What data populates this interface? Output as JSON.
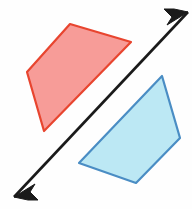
{
  "figure": {
    "canvas": {
      "width": 192,
      "height": 209,
      "background": "#fefefe"
    },
    "shapes": [
      {
        "id": "red-quadrilateral",
        "name": "preimage-quadrilateral",
        "kind": "quadrilateral",
        "role": "preimage",
        "fill": "#f79c98",
        "stroke": "#e8452f",
        "stroke_width": 2.2,
        "fill_opacity": 1,
        "points": "70,24 131,42 44,131 27,72",
        "vertices": [
          {
            "label": "A",
            "x": 70,
            "y": 24
          },
          {
            "label": "B",
            "x": 131,
            "y": 42
          },
          {
            "label": "C",
            "x": 44,
            "y": 131
          },
          {
            "label": "D",
            "x": 27,
            "y": 72
          }
        ]
      },
      {
        "id": "blue-quadrilateral",
        "name": "image-quadrilateral",
        "kind": "quadrilateral",
        "role": "image",
        "fill": "#bce8f4",
        "stroke": "#4a8dc4",
        "stroke_width": 2.2,
        "fill_opacity": 1,
        "points": "162,76 180,138 136,183 79,163",
        "vertices": [
          {
            "label": "A'",
            "x": 162,
            "y": 76
          },
          {
            "label": "B'",
            "x": 180,
            "y": 138
          },
          {
            "label": "C'",
            "x": 136,
            "y": 183
          },
          {
            "label": "D'",
            "x": 79,
            "y": 163
          }
        ]
      }
    ],
    "line": {
      "id": "mirror-line",
      "name": "line-of-reflection",
      "color": "#1a1a1a",
      "stroke_width": 2.6,
      "double_headed": true,
      "start": {
        "x": 14,
        "y": 197
      },
      "end": {
        "x": 188,
        "y": 12
      },
      "arrowheads": [
        {
          "name": "arrowhead-lower-left",
          "tip_x": 14,
          "tip_y": 197,
          "points": "14,197 35,184 30,192 38,200 28,200"
        },
        {
          "name": "arrowhead-upper-right",
          "tip_x": 188,
          "tip_y": 12,
          "points": "188,12 167,25 172,17 164,9 174,9"
        }
      ]
    }
  }
}
